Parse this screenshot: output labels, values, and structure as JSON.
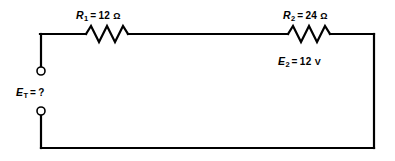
{
  "figure": {
    "kind": "series-circuit-schematic",
    "background_color": "#ffffff",
    "wire_color": "#000000",
    "text_color": "#000000"
  },
  "components": {
    "r1": {
      "symbol": "R",
      "subscript": "1",
      "equals": "=",
      "value": "12",
      "unit": "Ω",
      "full_label": "R1 = 12 Ω",
      "element_name": "resistor-r1"
    },
    "r2": {
      "symbol": "R",
      "subscript": "2",
      "equals": "=",
      "value": "24",
      "unit": "Ω",
      "full_label": "R2 = 24 Ω",
      "element_name": "resistor-r2"
    },
    "e2": {
      "symbol": "E",
      "subscript": "2",
      "equals": "=",
      "value": "12",
      "unit": "V",
      "full_label": "E2 = 12 V"
    },
    "et": {
      "symbol": "E",
      "subscript": "T",
      "equals": "=",
      "value": "?",
      "unit": "",
      "full_label": "ET = ?"
    }
  },
  "terminals": {
    "top": {
      "name": "terminal-top",
      "cx": 41,
      "cy": 71,
      "r": 4
    },
    "bottom": {
      "name": "terminal-bottom",
      "cx": 41,
      "cy": 111,
      "r": 4
    }
  }
}
